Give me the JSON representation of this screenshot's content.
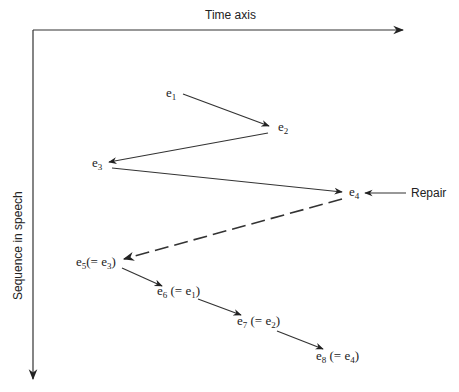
{
  "axes": {
    "x_label": "Time axis",
    "y_label": "Sequence in speech"
  },
  "nodes": [
    {
      "id": "e1",
      "base": "e",
      "sub": "1",
      "suffix": "",
      "x": 166,
      "y": 97
    },
    {
      "id": "e2",
      "base": "e",
      "sub": "2",
      "suffix": "",
      "x": 278,
      "y": 131
    },
    {
      "id": "e3",
      "base": "e",
      "sub": "3",
      "suffix": "",
      "x": 92,
      "y": 167
    },
    {
      "id": "e4",
      "base": "e",
      "sub": "4",
      "suffix": "",
      "x": 349,
      "y": 196
    },
    {
      "id": "e5",
      "base": "e",
      "sub": "5",
      "paren_open": "(= e",
      "paren_sub": "3",
      "paren_close": ")",
      "x": 76,
      "y": 266
    },
    {
      "id": "e6",
      "base": "e",
      "sub": "6",
      "paren_open": " (= e",
      "paren_sub": "1",
      "paren_close": ")",
      "x": 157,
      "y": 295
    },
    {
      "id": "e7",
      "base": "e",
      "sub": "7",
      "paren_open": " (= e",
      "paren_sub": "2",
      "paren_close": ")",
      "x": 237,
      "y": 325
    },
    {
      "id": "e8",
      "base": "e",
      "sub": "8",
      "paren_open": " (= e",
      "paren_sub": "4",
      "paren_close": ")",
      "x": 316,
      "y": 360
    }
  ],
  "edges": [
    {
      "from": "e1",
      "to": "e2",
      "style": "solid"
    },
    {
      "from": "e2",
      "to": "e3",
      "style": "solid"
    },
    {
      "from": "e3",
      "to": "e4",
      "style": "solid"
    },
    {
      "from": "e4",
      "to": "e5",
      "style": "dashed"
    },
    {
      "from": "e5",
      "to": "e6",
      "style": "solid"
    },
    {
      "from": "e6",
      "to": "e7",
      "style": "solid"
    },
    {
      "from": "e7",
      "to": "e8",
      "style": "solid"
    }
  ],
  "annotation": {
    "label": "Repair",
    "target": "e4"
  }
}
